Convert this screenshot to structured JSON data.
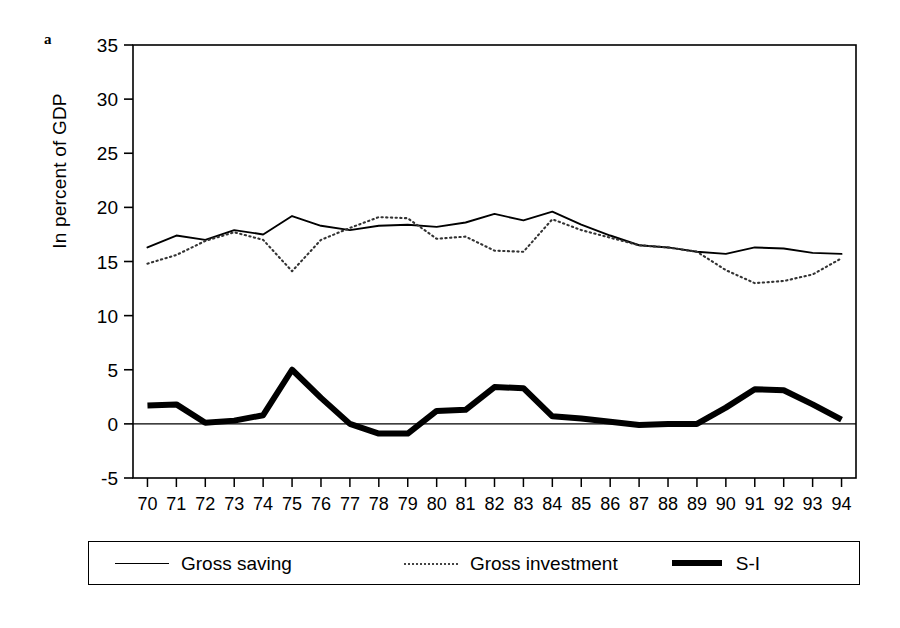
{
  "panel": {
    "label": "a"
  },
  "axes": {
    "ylabel": "In percent of GDP",
    "yticks": [
      "35",
      "30",
      "25",
      "20",
      "15",
      "10",
      "5",
      "0",
      "-5"
    ],
    "xticks": [
      "70",
      "71",
      "72",
      "73",
      "74",
      "75",
      "76",
      "77",
      "78",
      "79",
      "80",
      "81",
      "82",
      "83",
      "84",
      "85",
      "86",
      "87",
      "88",
      "89",
      "90",
      "91",
      "92",
      "93",
      "94"
    ]
  },
  "legend": {
    "items": [
      {
        "label": "Gross saving",
        "style": "solid-thin"
      },
      {
        "label": "Gross investment",
        "style": "dotted"
      },
      {
        "label": "S-I",
        "style": "solid-thick"
      }
    ]
  },
  "chart_data": {
    "type": "line",
    "title": "",
    "xlabel": "",
    "ylabel": "In percent of GDP",
    "ylim": [
      -5,
      35
    ],
    "ytick_step": 5,
    "grid": false,
    "legend_position": "bottom",
    "categories": [
      "70",
      "71",
      "72",
      "73",
      "74",
      "75",
      "76",
      "77",
      "78",
      "79",
      "80",
      "81",
      "82",
      "83",
      "84",
      "85",
      "86",
      "87",
      "88",
      "89",
      "90",
      "91",
      "92",
      "93",
      "94"
    ],
    "series": [
      {
        "name": "Gross saving",
        "style": "solid-thin",
        "values": [
          16.3,
          17.4,
          17.0,
          17.9,
          17.5,
          19.2,
          18.3,
          17.9,
          18.3,
          18.4,
          18.2,
          18.6,
          19.4,
          18.8,
          19.6,
          18.4,
          17.4,
          16.5,
          16.3,
          15.9,
          15.7,
          16.3,
          16.2,
          15.8,
          15.7
        ]
      },
      {
        "name": "Gross investment",
        "style": "dotted",
        "values": [
          14.8,
          15.6,
          16.9,
          17.7,
          17.0,
          14.1,
          17.0,
          18.1,
          19.1,
          19.0,
          17.1,
          17.3,
          16.0,
          15.9,
          18.9,
          17.9,
          17.2,
          16.5,
          16.3,
          15.9,
          14.2,
          13.0,
          13.2,
          13.8,
          15.3
        ]
      },
      {
        "name": "S-I",
        "style": "solid-thick",
        "values": [
          1.7,
          1.8,
          0.1,
          0.3,
          0.8,
          5.0,
          2.4,
          0.0,
          -0.9,
          -0.9,
          1.2,
          1.3,
          3.4,
          3.3,
          0.7,
          0.5,
          0.2,
          -0.1,
          0.0,
          0.0,
          1.5,
          3.2,
          3.1,
          1.8,
          0.4
        ]
      }
    ],
    "zero_line": 0
  }
}
